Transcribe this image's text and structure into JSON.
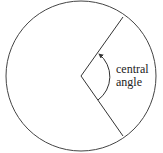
{
  "diagram": {
    "label_line1": "central",
    "label_line2": "angle",
    "stroke_color": "#333333",
    "background": "#ffffff"
  }
}
